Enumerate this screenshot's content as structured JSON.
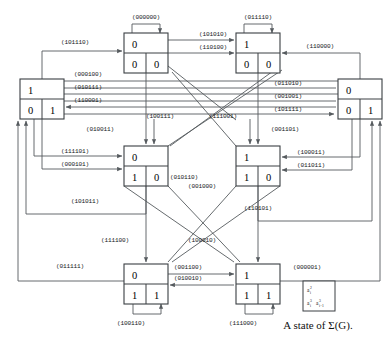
{
  "figure": {
    "caption": "A state of Σ(G).",
    "nodes": [
      {
        "id": "n-top-left",
        "top": "0",
        "bottom_left": "0",
        "bottom_right": "0",
        "x": 124,
        "y": 33,
        "w": 44,
        "h": 40
      },
      {
        "id": "n-top-right",
        "top": "1",
        "bottom_left": "0",
        "bottom_right": "0",
        "x": 236,
        "y": 33,
        "w": 44,
        "h": 40
      },
      {
        "id": "n-left",
        "top": "1",
        "bottom_left": "0",
        "bottom_right": "1",
        "x": 20,
        "y": 79,
        "w": 44,
        "h": 40
      },
      {
        "id": "n-right",
        "top": "0",
        "bottom_left": "0",
        "bottom_right": "1",
        "x": 338,
        "y": 79,
        "w": 44,
        "h": 40
      },
      {
        "id": "n-mid-left",
        "top": "0",
        "bottom_left": "1",
        "bottom_right": "0",
        "x": 124,
        "y": 146,
        "w": 44,
        "h": 40
      },
      {
        "id": "n-mid-right",
        "top": "1",
        "bottom_left": "1",
        "bottom_right": "0",
        "x": 236,
        "y": 146,
        "w": 44,
        "h": 40
      },
      {
        "id": "n-bottom-left",
        "top": "0",
        "bottom_left": "1",
        "bottom_right": "1",
        "x": 124,
        "y": 264,
        "w": 44,
        "h": 40
      },
      {
        "id": "n-bottom-right",
        "top": "1",
        "bottom_left": "1",
        "bottom_right": "1",
        "x": 236,
        "y": 264,
        "w": 44,
        "h": 40
      }
    ],
    "edge_labels": [
      {
        "id": "lbl-000000",
        "text": "(000000)",
        "x": 146,
        "y": 19
      },
      {
        "id": "lbl-011110",
        "text": "(011110)",
        "x": 258,
        "y": 19
      },
      {
        "id": "lbl-101010",
        "text": "(101010)",
        "x": 213,
        "y": 33
      },
      {
        "id": "lbl-110100",
        "text": "(110100)",
        "x": 213,
        "y": 46
      },
      {
        "id": "lbl-101110",
        "text": "(101110)",
        "x": 75,
        "y": 45
      },
      {
        "id": "lbl-110000",
        "text": "(110000)",
        "x": 320,
        "y": 47
      },
      {
        "id": "lbl-000100",
        "text": "(000100)",
        "x": 88,
        "y": 74
      },
      {
        "id": "lbl-010111",
        "text": "(010111)",
        "x": 88,
        "y": 87
      },
      {
        "id": "lbl-110001",
        "text": "(110001)",
        "x": 88,
        "y": 100
      },
      {
        "id": "lbl-011010",
        "text": "(011010)",
        "x": 288,
        "y": 83
      },
      {
        "id": "lbl-001001",
        "text": "(001001)",
        "x": 288,
        "y": 96
      },
      {
        "id": "lbl-101111",
        "text": "(101111)",
        "x": 288,
        "y": 109
      },
      {
        "id": "lbl-100111",
        "text": "(100111)",
        "x": 160,
        "y": 116
      },
      {
        "id": "lbl-111001",
        "text": "(111001)",
        "x": 223,
        "y": 116
      },
      {
        "id": "lbl-001101",
        "text": "(001101)",
        "x": 283,
        "y": 128
      },
      {
        "id": "lbl-010011",
        "text": "(010011)",
        "x": 100,
        "y": 129
      },
      {
        "id": "lbl-111101",
        "text": "(111101)",
        "x": 75,
        "y": 151
      },
      {
        "id": "lbl-000101",
        "text": "(000101)",
        "x": 75,
        "y": 164
      },
      {
        "id": "lbl-100011",
        "text": "(100011)",
        "x": 311,
        "y": 152
      },
      {
        "id": "lbl-011011",
        "text": "(011011)",
        "x": 311,
        "y": 165
      },
      {
        "id": "lbl-010110",
        "text": "(010110)",
        "x": 184,
        "y": 177
      },
      {
        "id": "lbl-001000",
        "text": "(001000)",
        "x": 200,
        "y": 186
      },
      {
        "id": "lbl-101011",
        "text": "(101011)",
        "x": 85,
        "y": 201
      },
      {
        "id": "lbl-110101",
        "text": "(110101)",
        "x": 258,
        "y": 208
      },
      {
        "id": "lbl-111100",
        "text": "(111100)",
        "x": 115,
        "y": 240
      },
      {
        "id": "lbl-100010",
        "text": "(100010)",
        "x": 200,
        "y": 240
      },
      {
        "id": "lbl-011111",
        "text": "(011111)",
        "x": 70,
        "y": 266
      },
      {
        "id": "lbl-001100",
        "text": "(001100)",
        "x": 186,
        "y": 267
      },
      {
        "id": "lbl-010010",
        "text": "(010010)",
        "x": 186,
        "y": 277
      },
      {
        "id": "lbl-000001",
        "text": "(000001)",
        "x": 305,
        "y": 267
      },
      {
        "id": "lbl-100110",
        "text": "(100110)",
        "x": 131,
        "y": 321
      },
      {
        "id": "lbl-111000",
        "text": "(111000)",
        "x": 243,
        "y": 321
      }
    ],
    "legend": {
      "id": "legend-box",
      "line1_base": "a",
      "line1_sub": "i",
      "line1_sup": "2",
      "line2a_base": "a",
      "line2a_sub": "i",
      "line2a_sup": "3",
      "line2b_base": "a",
      "line2b_sub": "i−1",
      "line2b_sup": "3"
    }
  }
}
